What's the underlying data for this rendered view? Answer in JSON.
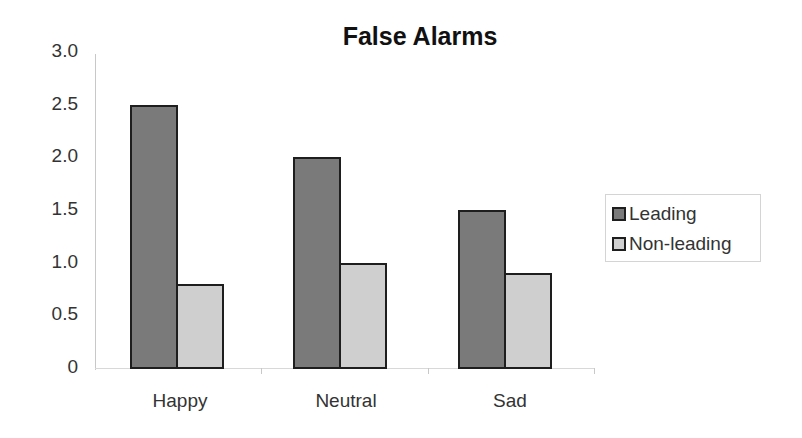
{
  "chart_data": {
    "type": "bar",
    "title": "False Alarms",
    "xlabel": "",
    "ylabel": "",
    "categories": [
      "Happy",
      "Neutral",
      "Sad"
    ],
    "series": [
      {
        "name": "Leading",
        "values": [
          2.5,
          2.0,
          1.5
        ],
        "color": "#7a7a7a"
      },
      {
        "name": "Non-leading",
        "values": [
          0.8,
          1.0,
          0.9
        ],
        "color": "#cfcfcf"
      }
    ],
    "ylim": [
      0,
      3.0
    ],
    "yticks": [
      "0",
      "0.5",
      "1.0",
      "1.5",
      "2.0",
      "2.5",
      "3.0"
    ],
    "grid": false,
    "legend_position": "right"
  }
}
